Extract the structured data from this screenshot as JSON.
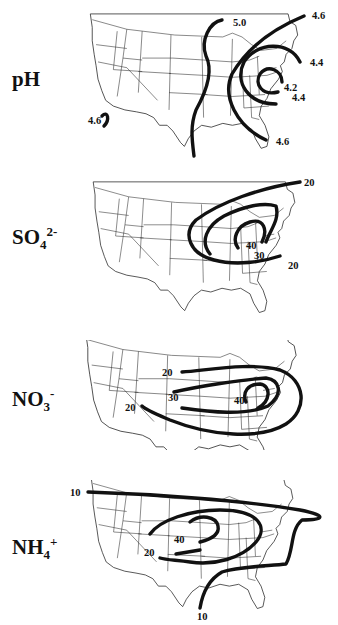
{
  "figure": {
    "panels": [
      {
        "id": "ph",
        "label_main": "pH",
        "label_sub": "",
        "label_sup": "",
        "contour_labels": [
          "5.0",
          "4.6",
          "4.4",
          "4.2",
          "4.4",
          "4.6",
          "4.6",
          "5.0"
        ]
      },
      {
        "id": "so4",
        "label_main": "SO",
        "label_sub": "4",
        "label_sup": "2-",
        "contour_labels": [
          "20",
          "40",
          "30",
          "20"
        ]
      },
      {
        "id": "no3",
        "label_main": "NO",
        "label_sub": "3",
        "label_sup": "-",
        "contour_labels": [
          "20",
          "30",
          "20",
          "40"
        ]
      },
      {
        "id": "nh4",
        "label_main": "NH",
        "label_sub": "4",
        "label_sup": "+",
        "contour_labels": [
          "10",
          "40",
          "20",
          "10"
        ]
      }
    ]
  }
}
